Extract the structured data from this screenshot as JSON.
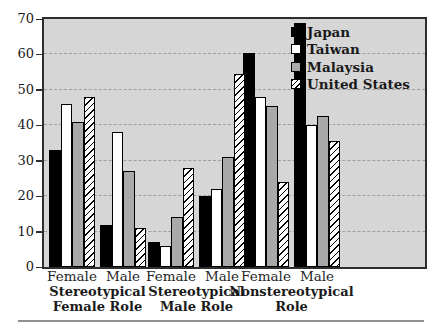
{
  "chart_data": {
    "type": "bar",
    "title": "",
    "xlabel": "",
    "ylabel": "",
    "categories": [
      "Female",
      "Male",
      "Female",
      "Male",
      "Female",
      "Male"
    ],
    "group_labels": [
      "Stereotypical Female Role",
      "Stereotypical Male Role",
      "Nonstereotypical Role"
    ],
    "series": [
      {
        "name": "Japan",
        "fill": "#000000",
        "pattern": "solid",
        "values": [
          33,
          12,
          7,
          20,
          60.5,
          69
        ]
      },
      {
        "name": "Taiwan",
        "fill": "#ffffff",
        "pattern": "solid",
        "values": [
          46,
          38,
          6,
          22,
          48,
          40
        ]
      },
      {
        "name": "Malaysia",
        "fill": "#a9a9a9",
        "pattern": "solid",
        "values": [
          41,
          27,
          14,
          31,
          45.5,
          42.5
        ]
      },
      {
        "name": "United States",
        "fill": "#ffffff",
        "pattern": "diagonal-hatch",
        "values": [
          48,
          11,
          28,
          54.5,
          24,
          35.5
        ]
      }
    ],
    "ylim": [
      0,
      70
    ],
    "yticks": [
      0,
      10,
      20,
      30,
      40,
      50,
      60,
      70
    ],
    "grid": "dashed-horizontal",
    "legend_position": "top-right-inside",
    "plot_bg": "#d6d6d6",
    "gridline_color": "#9e9e9e",
    "axis_color": "#2e2e2e"
  }
}
